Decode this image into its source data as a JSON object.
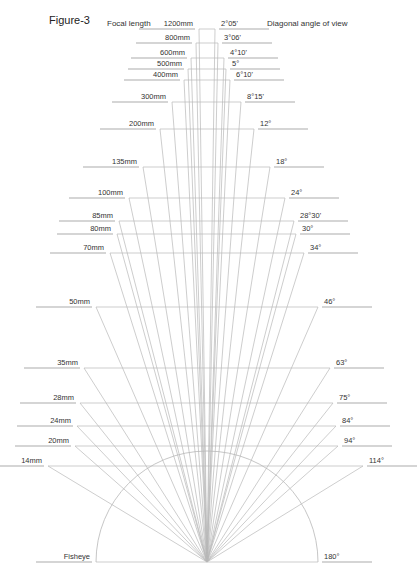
{
  "figure": {
    "title": "Figure-3",
    "header_left": "Focal length",
    "header_right": "Diagonal angle of view",
    "colors": {
      "lines": "#b8b8b8",
      "text": "#333333",
      "background": "#ffffff"
    },
    "apex": [
      207,
      562
    ],
    "arc_radius": 111
  },
  "chart_data": {
    "type": "diagram",
    "title": "Figure-3",
    "xlabel": "Focal length",
    "ylabel": "Diagonal angle of view",
    "levels": [
      {
        "focal": "1200mm",
        "angle": "2°05'",
        "y": 29,
        "xl": 199,
        "xr": 215
      },
      {
        "focal": "800mm",
        "angle": "3°06'",
        "y": 43,
        "xl": 196,
        "xr": 218
      },
      {
        "focal": "600mm",
        "angle": "4°10'",
        "y": 58,
        "xl": 191,
        "xr": 224
      },
      {
        "focal": "500mm",
        "angle": "5°",
        "y": 69,
        "xl": 188,
        "xr": 226
      },
      {
        "focal": "400mm",
        "angle": "6°10'",
        "y": 80,
        "xl": 184,
        "xr": 230
      },
      {
        "focal": "300mm",
        "angle": "8°15'",
        "y": 102,
        "xl": 172,
        "xr": 241
      },
      {
        "focal": "200mm",
        "angle": "12°",
        "y": 129,
        "xl": 160,
        "xr": 254
      },
      {
        "focal": "135mm",
        "angle": "18°",
        "y": 167,
        "xl": 143,
        "xr": 270
      },
      {
        "focal": "100mm",
        "angle": "24°",
        "y": 198,
        "xl": 129,
        "xr": 285
      },
      {
        "focal": "85mm",
        "angle": "28°30'",
        "y": 221,
        "xl": 119,
        "xr": 294
      },
      {
        "focal": "80mm",
        "angle": "30°",
        "y": 234,
        "xl": 117,
        "xr": 296
      },
      {
        "focal": "70mm",
        "angle": "34°",
        "y": 253,
        "xl": 110,
        "xr": 304
      },
      {
        "focal": "50mm",
        "angle": "46°",
        "y": 307,
        "xl": 96,
        "xr": 318
      },
      {
        "focal": "35mm",
        "angle": "63°",
        "y": 368,
        "xl": 84,
        "xr": 330
      },
      {
        "focal": "28mm",
        "angle": "75°",
        "y": 403,
        "xl": 80,
        "xr": 333
      },
      {
        "focal": "24mm",
        "angle": "84°",
        "y": 426,
        "xl": 77,
        "xr": 336
      },
      {
        "focal": "20mm",
        "angle": "94°",
        "y": 446,
        "xl": 75,
        "xr": 338
      },
      {
        "focal": "14mm",
        "angle": "114°",
        "y": 466,
        "xl": 48,
        "xr": 363
      }
    ],
    "fisheye": {
      "focal": "Fisheye",
      "angle": "180°",
      "y": 562,
      "xl": 96,
      "xr": 318
    }
  }
}
